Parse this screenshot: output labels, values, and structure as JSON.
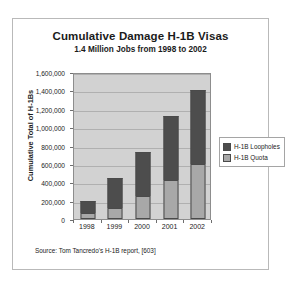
{
  "chart_data": {
    "type": "bar",
    "stacked": true,
    "title": "Cumulative Damage H-1B Visas",
    "subtitle": "1.4 Million Jobs from 1998 to 2002",
    "xlabel": "",
    "ylabel": "Cumulative Total of H-1Bs",
    "categories": [
      "1998",
      "1999",
      "2000",
      "2001",
      "2002"
    ],
    "series": [
      {
        "name": "H-1B Quota",
        "color": "#a8a8a8",
        "values": [
          65000,
          115000,
          250000,
          425000,
          600000
        ]
      },
      {
        "name": "H-1B Loopholes",
        "color": "#4d4d4d",
        "values": [
          135000,
          335000,
          475000,
          700000,
          800000
        ]
      }
    ],
    "totals": [
      200000,
      450000,
      725000,
      1125000,
      1400000
    ],
    "ylim": [
      0,
      1600000
    ],
    "ytick_values": [
      0,
      200000,
      400000,
      600000,
      800000,
      1000000,
      1200000,
      1400000,
      1600000
    ],
    "ytick_labels": [
      "0",
      "200,000",
      "400,000",
      "600,000",
      "800,000",
      "1,000,000",
      "1,200,000",
      "1,400,000",
      "1,600,000"
    ],
    "grid": true,
    "legend_position": "right",
    "legend_order": [
      "H-1B Loopholes",
      "H-1B Quota"
    ],
    "plot_background": "#d2d2d2",
    "source": "Source: Tom Tancredo's H-1B report, [603]"
  }
}
